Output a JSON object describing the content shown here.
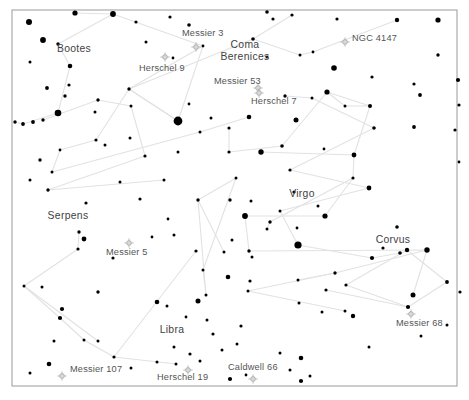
{
  "chart": {
    "background_color": "#ffffff",
    "frame_color": "#9a9a9a",
    "star_color": "#000000",
    "constellation_line_color": "#e2e2e2",
    "dso_marker_color": "#a8a8a8",
    "label_color": "#3b3b3b",
    "frame": {
      "x": 12,
      "y": 10,
      "width": 445,
      "height": 376
    }
  },
  "chart_data": {
    "type": "scatter",
    "xlabel": "",
    "ylabel": "",
    "xlim": [
      12,
      457
    ],
    "ylim": [
      10,
      386
    ],
    "grid": false,
    "legend": "none",
    "series": [
      {
        "name": "stars",
        "note": "x, y in pixel coordinates; r = plotted dot radius in px (proxy for apparent magnitude)",
        "points": [
          {
            "x": 29,
            "y": 22,
            "r": 3.0
          },
          {
            "x": 43,
            "y": 40,
            "r": 2.9
          },
          {
            "x": 30,
            "y": 62,
            "r": 1.5
          },
          {
            "x": 58,
            "y": 44,
            "r": 1.7
          },
          {
            "x": 75,
            "y": 13,
            "r": 2.6
          },
          {
            "x": 113,
            "y": 14,
            "r": 2.9
          },
          {
            "x": 136,
            "y": 22,
            "r": 1.6
          },
          {
            "x": 170,
            "y": 17,
            "r": 1.6
          },
          {
            "x": 146,
            "y": 42,
            "r": 1.5
          },
          {
            "x": 189,
            "y": 25,
            "r": 1.8
          },
          {
            "x": 203,
            "y": 46,
            "r": 1.4
          },
          {
            "x": 173,
            "y": 58,
            "r": 1.4
          },
          {
            "x": 70,
            "y": 66,
            "r": 2.3
          },
          {
            "x": 69,
            "y": 85,
            "r": 1.6
          },
          {
            "x": 47,
            "y": 88,
            "r": 1.9
          },
          {
            "x": 65,
            "y": 96,
            "r": 1.7
          },
          {
            "x": 58,
            "y": 113,
            "r": 3.3
          },
          {
            "x": 43,
            "y": 120,
            "r": 1.7
          },
          {
            "x": 33,
            "y": 122,
            "r": 1.9
          },
          {
            "x": 23,
            "y": 124,
            "r": 1.9
          },
          {
            "x": 15,
            "y": 122,
            "r": 1.7
          },
          {
            "x": 98,
            "y": 100,
            "r": 1.7
          },
          {
            "x": 95,
            "y": 112,
            "r": 1.5
          },
          {
            "x": 129,
            "y": 89,
            "r": 1.7
          },
          {
            "x": 178,
            "y": 121,
            "r": 4.4
          },
          {
            "x": 131,
            "y": 106,
            "r": 1.5
          },
          {
            "x": 96,
            "y": 140,
            "r": 1.6
          },
          {
            "x": 105,
            "y": 145,
            "r": 1.5
          },
          {
            "x": 130,
            "y": 138,
            "r": 1.5
          },
          {
            "x": 145,
            "y": 156,
            "r": 1.6
          },
          {
            "x": 60,
            "y": 150,
            "r": 1.4
          },
          {
            "x": 40,
            "y": 160,
            "r": 1.7
          },
          {
            "x": 30,
            "y": 180,
            "r": 1.5
          },
          {
            "x": 48,
            "y": 190,
            "r": 1.7
          },
          {
            "x": 52,
            "y": 172,
            "r": 1.5
          },
          {
            "x": 120,
            "y": 182,
            "r": 1.5
          },
          {
            "x": 164,
            "y": 180,
            "r": 1.5
          },
          {
            "x": 200,
            "y": 132,
            "r": 1.5
          },
          {
            "x": 211,
            "y": 118,
            "r": 1.5
          },
          {
            "x": 189,
            "y": 104,
            "r": 1.4
          },
          {
            "x": 249,
            "y": 117,
            "r": 2.3
          },
          {
            "x": 253,
            "y": 39,
            "r": 1.8
          },
          {
            "x": 267,
            "y": 12,
            "r": 1.8
          },
          {
            "x": 267,
            "y": 57,
            "r": 1.5
          },
          {
            "x": 273,
            "y": 19,
            "r": 1.6
          },
          {
            "x": 292,
            "y": 15,
            "r": 1.6
          },
          {
            "x": 300,
            "y": 55,
            "r": 1.5
          },
          {
            "x": 313,
            "y": 52,
            "r": 1.4
          },
          {
            "x": 337,
            "y": 19,
            "r": 1.6
          },
          {
            "x": 334,
            "y": 68,
            "r": 2.8
          },
          {
            "x": 397,
            "y": 20,
            "r": 2.2
          },
          {
            "x": 438,
            "y": 20,
            "r": 2.6
          },
          {
            "x": 438,
            "y": 55,
            "r": 1.7
          },
          {
            "x": 458,
            "y": 80,
            "r": 2.1
          },
          {
            "x": 414,
            "y": 84,
            "r": 1.6
          },
          {
            "x": 420,
            "y": 95,
            "r": 1.9
          },
          {
            "x": 414,
            "y": 127,
            "r": 1.9
          },
          {
            "x": 459,
            "y": 105,
            "r": 1.6
          },
          {
            "x": 455,
            "y": 130,
            "r": 1.6
          },
          {
            "x": 459,
            "y": 162,
            "r": 1.4
          },
          {
            "x": 229,
            "y": 128,
            "r": 1.6
          },
          {
            "x": 229,
            "y": 152,
            "r": 1.6
          },
          {
            "x": 285,
            "y": 96,
            "r": 1.7
          },
          {
            "x": 296,
            "y": 120,
            "r": 2.5
          },
          {
            "x": 282,
            "y": 146,
            "r": 1.8
          },
          {
            "x": 312,
            "y": 98,
            "r": 1.5
          },
          {
            "x": 327,
            "y": 92,
            "r": 2.6
          },
          {
            "x": 345,
            "y": 106,
            "r": 1.5
          },
          {
            "x": 370,
            "y": 106,
            "r": 2.0
          },
          {
            "x": 374,
            "y": 128,
            "r": 1.8
          },
          {
            "x": 372,
            "y": 77,
            "r": 1.6
          },
          {
            "x": 354,
            "y": 155,
            "r": 2.4
          },
          {
            "x": 324,
            "y": 149,
            "r": 1.4
          },
          {
            "x": 290,
            "y": 170,
            "r": 1.6
          },
          {
            "x": 261,
            "y": 152,
            "r": 2.7
          },
          {
            "x": 353,
            "y": 178,
            "r": 1.6
          },
          {
            "x": 294,
            "y": 192,
            "r": 1.6
          },
          {
            "x": 369,
            "y": 188,
            "r": 2.4
          },
          {
            "x": 325,
            "y": 216,
            "r": 2.6
          },
          {
            "x": 318,
            "y": 206,
            "r": 1.5
          },
          {
            "x": 297,
            "y": 228,
            "r": 1.4
          },
          {
            "x": 280,
            "y": 211,
            "r": 1.5
          },
          {
            "x": 270,
            "y": 222,
            "r": 1.7
          },
          {
            "x": 245,
            "y": 216,
            "r": 2.9
          },
          {
            "x": 230,
            "y": 200,
            "r": 1.7
          },
          {
            "x": 298,
            "y": 245,
            "r": 3.6
          },
          {
            "x": 267,
            "y": 229,
            "r": 1.5
          },
          {
            "x": 249,
            "y": 251,
            "r": 1.7
          },
          {
            "x": 383,
            "y": 248,
            "r": 1.6
          },
          {
            "x": 372,
            "y": 258,
            "r": 2.1
          },
          {
            "x": 397,
            "y": 227,
            "r": 1.8
          },
          {
            "x": 407,
            "y": 250,
            "r": 2.2
          },
          {
            "x": 400,
            "y": 253,
            "r": 1.8
          },
          {
            "x": 427,
            "y": 250,
            "r": 2.7
          },
          {
            "x": 447,
            "y": 282,
            "r": 1.9
          },
          {
            "x": 460,
            "y": 292,
            "r": 1.6
          },
          {
            "x": 413,
            "y": 295,
            "r": 2.5
          },
          {
            "x": 408,
            "y": 307,
            "r": 2.1
          },
          {
            "x": 335,
            "y": 273,
            "r": 1.7
          },
          {
            "x": 346,
            "y": 285,
            "r": 1.6
          },
          {
            "x": 326,
            "y": 290,
            "r": 1.6
          },
          {
            "x": 298,
            "y": 280,
            "r": 1.5
          },
          {
            "x": 299,
            "y": 303,
            "r": 1.5
          },
          {
            "x": 250,
            "y": 281,
            "r": 1.6
          },
          {
            "x": 248,
            "y": 291,
            "r": 1.5
          },
          {
            "x": 252,
            "y": 257,
            "r": 1.5
          },
          {
            "x": 322,
            "y": 312,
            "r": 1.5
          },
          {
            "x": 345,
            "y": 311,
            "r": 1.5
          },
          {
            "x": 353,
            "y": 316,
            "r": 2.2
          },
          {
            "x": 369,
            "y": 347,
            "r": 1.5
          },
          {
            "x": 301,
            "y": 358,
            "r": 2.3
          },
          {
            "x": 290,
            "y": 370,
            "r": 1.5
          },
          {
            "x": 310,
            "y": 376,
            "r": 1.5
          },
          {
            "x": 301,
            "y": 381,
            "r": 2.1
          },
          {
            "x": 280,
            "y": 353,
            "r": 1.5
          },
          {
            "x": 230,
            "y": 379,
            "r": 2.1
          },
          {
            "x": 246,
            "y": 375,
            "r": 1.4
          },
          {
            "x": 237,
            "y": 344,
            "r": 1.5
          },
          {
            "x": 198,
            "y": 301,
            "r": 2.5
          },
          {
            "x": 186,
            "y": 317,
            "r": 1.4
          },
          {
            "x": 167,
            "y": 306,
            "r": 1.5
          },
          {
            "x": 174,
            "y": 347,
            "r": 1.5
          },
          {
            "x": 157,
            "y": 302,
            "r": 2.3
          },
          {
            "x": 190,
            "y": 354,
            "r": 1.6
          },
          {
            "x": 213,
            "y": 334,
            "r": 1.6
          },
          {
            "x": 168,
            "y": 219,
            "r": 1.4
          },
          {
            "x": 152,
            "y": 237,
            "r": 1.4
          },
          {
            "x": 174,
            "y": 235,
            "r": 1.5
          },
          {
            "x": 86,
            "y": 203,
            "r": 1.6
          },
          {
            "x": 79,
            "y": 232,
            "r": 1.7
          },
          {
            "x": 84,
            "y": 239,
            "r": 2.4
          },
          {
            "x": 78,
            "y": 249,
            "r": 1.6
          },
          {
            "x": 98,
            "y": 292,
            "r": 1.7
          },
          {
            "x": 24,
            "y": 286,
            "r": 1.5
          },
          {
            "x": 42,
            "y": 287,
            "r": 1.5
          },
          {
            "x": 62,
            "y": 309,
            "r": 2.1
          },
          {
            "x": 60,
            "y": 318,
            "r": 2.1
          },
          {
            "x": 54,
            "y": 341,
            "r": 1.5
          },
          {
            "x": 84,
            "y": 340,
            "r": 1.5
          },
          {
            "x": 98,
            "y": 341,
            "r": 1.5
          },
          {
            "x": 49,
            "y": 364,
            "r": 2.3
          },
          {
            "x": 114,
            "y": 357,
            "r": 1.6
          },
          {
            "x": 30,
            "y": 373,
            "r": 1.5
          },
          {
            "x": 131,
            "y": 368,
            "r": 1.5
          },
          {
            "x": 157,
            "y": 362,
            "r": 1.5
          },
          {
            "x": 176,
            "y": 364,
            "r": 1.5
          },
          {
            "x": 200,
            "y": 361,
            "r": 1.5
          },
          {
            "x": 222,
            "y": 350,
            "r": 1.5
          },
          {
            "x": 241,
            "y": 326,
            "r": 1.6
          },
          {
            "x": 196,
            "y": 251,
            "r": 1.6
          },
          {
            "x": 232,
            "y": 240,
            "r": 1.5
          },
          {
            "x": 203,
            "y": 270,
            "r": 1.5
          },
          {
            "x": 228,
            "y": 277,
            "r": 2.3
          },
          {
            "x": 206,
            "y": 295,
            "r": 1.5
          },
          {
            "x": 207,
            "y": 320,
            "r": 1.5
          },
          {
            "x": 198,
            "y": 200,
            "r": 1.7
          },
          {
            "x": 178,
            "y": 152,
            "r": 1.5
          },
          {
            "x": 236,
            "y": 178,
            "r": 1.5
          },
          {
            "x": 251,
            "y": 201,
            "r": 1.5
          },
          {
            "x": 224,
            "y": 252,
            "r": 1.5
          },
          {
            "x": 113,
            "y": 258,
            "r": 1.6
          },
          {
            "x": 140,
            "y": 199,
            "r": 1.6
          },
          {
            "x": 421,
            "y": 336,
            "r": 1.5
          },
          {
            "x": 447,
            "y": 325,
            "r": 1.5
          }
        ]
      }
    ],
    "constellation_labels": [
      {
        "name": "Bootes",
        "x": 74,
        "y": 52
      },
      {
        "name": "Coma Berenices",
        "x": 245,
        "y": 48
      },
      {
        "name": "Virgo",
        "x": 302,
        "y": 197
      },
      {
        "name": "Serpens",
        "x": 68,
        "y": 219
      },
      {
        "name": "Libra",
        "x": 172,
        "y": 333
      },
      {
        "name": "Corvus",
        "x": 393,
        "y": 243
      }
    ],
    "deep_sky_objects": [
      {
        "name": "Messier 3",
        "label_x": 182,
        "label_y": 36,
        "marker_x": 196,
        "marker_y": 47
      },
      {
        "name": "Herschel 9",
        "label_x": 139,
        "label_y": 71,
        "marker_x": 165,
        "marker_y": 57
      },
      {
        "name": "Messier 53",
        "label_x": 214,
        "label_y": 84,
        "marker_x": 258,
        "marker_y": 88
      },
      {
        "name": "Herschel 7",
        "label_x": 251,
        "label_y": 104,
        "marker_x": 259,
        "marker_y": 93
      },
      {
        "name": "NGC 4147",
        "label_x": 352,
        "label_y": 41,
        "marker_x": 345,
        "marker_y": 42
      },
      {
        "name": "Messier 68",
        "label_x": 396,
        "label_y": 326,
        "marker_x": 411,
        "marker_y": 314
      },
      {
        "name": "Messier 5",
        "label_x": 106,
        "label_y": 255,
        "marker_x": 129,
        "marker_y": 243
      },
      {
        "name": "Messier 107",
        "label_x": 70,
        "label_y": 372,
        "marker_x": 62,
        "marker_y": 376
      },
      {
        "name": "Herschel 19",
        "label_x": 157,
        "label_y": 380,
        "marker_x": 188,
        "marker_y": 370
      },
      {
        "name": "Caldwell 66",
        "label_x": 228,
        "label_y": 370,
        "marker_x": 253,
        "marker_y": 379
      }
    ]
  }
}
